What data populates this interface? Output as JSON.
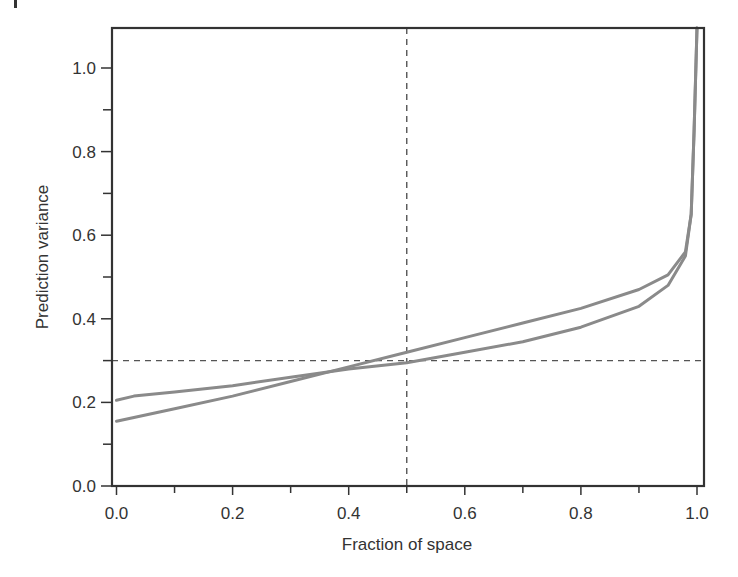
{
  "chart_data": {
    "type": "line",
    "title": "",
    "xlabel": "Fraction of space",
    "ylabel": "Prediction variance",
    "xlim": [
      0.0,
      1.0
    ],
    "ylim": [
      0.0,
      1.1
    ],
    "x_ticks": [
      "0.0",
      "0.2",
      "0.4",
      "0.6",
      "0.8",
      "1.0"
    ],
    "y_ticks": [
      "0.0",
      "0.2",
      "0.4",
      "0.6",
      "0.8",
      "1.0"
    ],
    "minor_tick_step": 0.1,
    "grid": false,
    "legend": null,
    "reference_lines": {
      "vertical_x": 0.5,
      "horizontal_y": 0.3,
      "style": "dashed"
    },
    "series": [
      {
        "name": "Design A",
        "color": "#8a8a8a",
        "x": [
          0.0,
          0.03,
          0.1,
          0.2,
          0.3,
          0.4,
          0.5,
          0.6,
          0.7,
          0.8,
          0.9,
          0.95,
          0.98,
          0.99,
          0.995,
          1.0
        ],
        "y": [
          0.205,
          0.215,
          0.225,
          0.24,
          0.26,
          0.28,
          0.295,
          0.32,
          0.345,
          0.38,
          0.43,
          0.48,
          0.55,
          0.65,
          0.85,
          1.1
        ]
      },
      {
        "name": "Design B",
        "color": "#8a8a8a",
        "x": [
          0.0,
          0.1,
          0.2,
          0.3,
          0.4,
          0.5,
          0.6,
          0.7,
          0.8,
          0.9,
          0.95,
          0.98,
          0.99,
          0.995,
          1.0
        ],
        "y": [
          0.155,
          0.185,
          0.215,
          0.25,
          0.285,
          0.32,
          0.355,
          0.39,
          0.425,
          0.47,
          0.505,
          0.56,
          0.65,
          0.85,
          1.1
        ]
      }
    ]
  },
  "labels": {
    "xlabel": "Fraction of space",
    "ylabel": "Prediction variance"
  }
}
